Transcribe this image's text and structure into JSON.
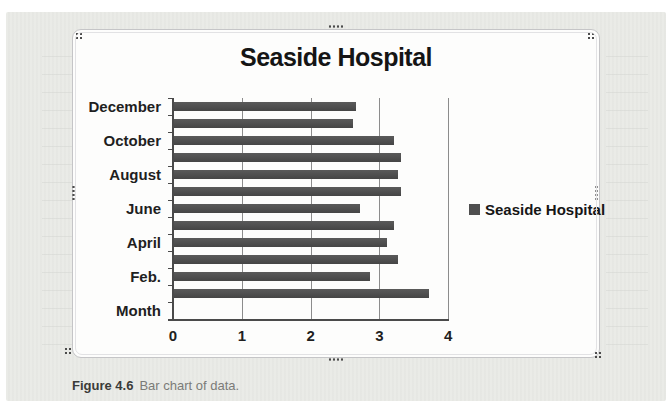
{
  "page": {
    "background_color": "#e9eae6",
    "caption": {
      "label": "Figure 4.6",
      "text": "Bar chart of data."
    }
  },
  "chart_data": {
    "type": "bar",
    "orientation": "horizontal",
    "title": "Seaside Hospital",
    "xlabel": "",
    "ylabel": "",
    "xlim": [
      0,
      4
    ],
    "xticks": [
      "0",
      "1",
      "2",
      "3",
      "4"
    ],
    "grid": "vertical major gridlines on",
    "legend_position": "right of plot",
    "bar_color": "#4f4f4f",
    "axis_color": "#4a4a4a",
    "gridline_color": "#8c8c8c",
    "categories_bottom_to_top": [
      "Month",
      "",
      "Feb.",
      "",
      "April",
      "",
      "June",
      "",
      "August",
      "",
      "October",
      "",
      "December"
    ],
    "series": [
      {
        "name": "Seaside Hospital",
        "values_bottom_to_top": [
          null,
          3.7,
          2.85,
          3.25,
          3.1,
          3.2,
          2.7,
          3.3,
          3.25,
          3.3,
          3.2,
          2.6,
          2.65
        ]
      }
    ]
  },
  "selection_handles": {
    "color": "#4b4b4b",
    "positions": [
      "top-left",
      "top-center",
      "top-right",
      "middle-left",
      "middle-right",
      "bottom-left",
      "bottom-center",
      "bottom-right"
    ]
  }
}
